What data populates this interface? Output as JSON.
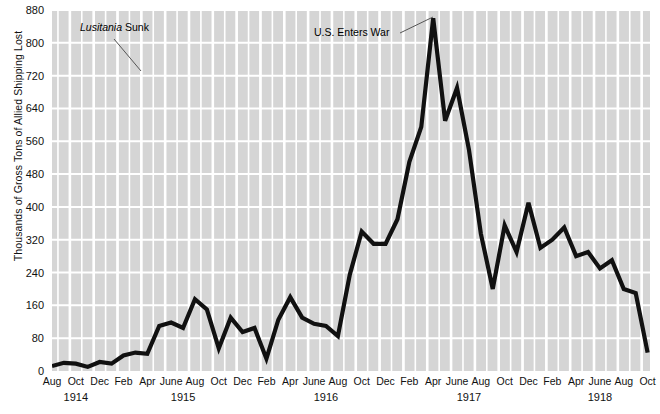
{
  "chart_data": {
    "type": "line",
    "title": "",
    "xlabel": "",
    "ylabel": "Thousands of Gross Tons of Allied Shipping Lost",
    "ylim": [
      0,
      880
    ],
    "yticks": [
      0,
      80,
      160,
      240,
      320,
      400,
      480,
      560,
      640,
      720,
      800,
      880
    ],
    "grid": true,
    "legend_position": "none",
    "line_color": "#111111",
    "plot_background": "#d5d5d5",
    "gridline_color": "#ffffff",
    "x_tick_labels": [
      "Aug",
      "Oct",
      "Dec",
      "Feb",
      "Apr",
      "June",
      "Aug",
      "Oct",
      "Dec",
      "Feb",
      "Apr",
      "June",
      "Aug",
      "Oct",
      "Dec",
      "Feb",
      "Apr",
      "June",
      "Aug",
      "Oct",
      "Dec",
      "Feb",
      "Apr",
      "June",
      "Aug",
      "Oct"
    ],
    "year_labels": [
      "1914",
      "1915",
      "1916",
      "1917",
      "1918"
    ],
    "x": [
      "Aug 1914",
      "Sep 1914",
      "Oct 1914",
      "Nov 1914",
      "Dec 1914",
      "Jan 1915",
      "Feb 1915",
      "Mar 1915",
      "Apr 1915",
      "May 1915",
      "June 1915",
      "July 1915",
      "Aug 1915",
      "Sep 1915",
      "Oct 1915",
      "Nov 1915",
      "Dec 1915",
      "Jan 1916",
      "Feb 1916",
      "Mar 1916",
      "Apr 1916",
      "May 1916",
      "June 1916",
      "July 1916",
      "Aug 1916",
      "Sep 1916",
      "Oct 1916",
      "Nov 1916",
      "Dec 1916",
      "Jan 1917",
      "Feb 1917",
      "Mar 1917",
      "Apr 1917",
      "May 1917",
      "June 1917",
      "July 1917",
      "Aug 1917",
      "Sep 1917",
      "Oct 1917",
      "Nov 1917",
      "Dec 1917",
      "Jan 1918",
      "Feb 1918",
      "Mar 1918",
      "Apr 1918",
      "May 1918",
      "June 1918",
      "July 1918",
      "Aug 1918",
      "Sep 1918",
      "Oct 1918"
    ],
    "values": [
      12,
      20,
      18,
      10,
      22,
      18,
      38,
      45,
      42,
      110,
      118,
      105,
      175,
      150,
      55,
      130,
      95,
      105,
      30,
      125,
      180,
      130,
      115,
      110,
      85,
      235,
      340,
      310,
      310,
      370,
      510,
      595,
      860,
      610,
      690,
      540,
      335,
      200,
      355,
      290,
      410,
      300,
      320,
      350,
      280,
      290,
      250,
      270,
      200,
      190,
      45
    ]
  },
  "annotations": [
    {
      "name": "lusitania-annotation",
      "text_italic": "Lusitania",
      "text_rest": " Sunk"
    },
    {
      "name": "us-enters-war-annotation",
      "text": "U.S. Enters War"
    }
  ]
}
